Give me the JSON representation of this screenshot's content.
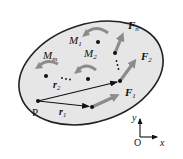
{
  "diagram": {
    "colors": {
      "body_fill": "#e6e6e6",
      "body_stroke": "#222222",
      "force_arrow": "#8c8c8c",
      "position_arrow": "#111111",
      "moment_arrow": "#8c8c8c",
      "dot": "#111111"
    },
    "labels": {
      "point_P": "P",
      "r1": "r",
      "r1_sub": "1",
      "r2": "r",
      "r2_sub": "2",
      "F1": "F",
      "F1_sub": "1",
      "F2": "F",
      "F2_sub": "2",
      "Fn": "F",
      "Fn_sub": "n",
      "M1": "M",
      "M1_sub": "1",
      "M2": "M",
      "M2_sub": "2",
      "Mm": "M",
      "Mm_sub": "m",
      "ellipsis_forces": "⋮",
      "ellipsis_moments": "⋯",
      "axis_origin": "O",
      "axis_x": "x",
      "axis_y": "y"
    },
    "forces": [
      {
        "name": "F1",
        "from": [
          92,
          107
        ],
        "to": [
          121,
          94
        ]
      },
      {
        "name": "F2",
        "from": [
          120,
          81
        ],
        "to": [
          138,
          57
        ]
      },
      {
        "name": "Fn",
        "from": [
          115,
          53
        ],
        "to": [
          124,
          31
        ]
      }
    ],
    "position_vectors": [
      {
        "name": "r1",
        "from": [
          38,
          101
        ],
        "to": [
          92,
          107
        ]
      },
      {
        "name": "r2",
        "from": [
          38,
          101
        ],
        "to": [
          120,
          81
        ]
      }
    ],
    "moments": [
      "M1",
      "M2",
      "Mm"
    ]
  }
}
